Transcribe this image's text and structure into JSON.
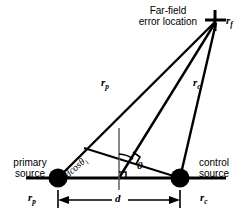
{
  "figure": {
    "title_note": "Far-field error location geometry for primary and control sources",
    "background_color": "#ffffff",
    "stroke_color": "#000000",
    "labels": {
      "farfield_line1": "Far-field",
      "farfield_line2": "error  location",
      "primary_line1": "primary",
      "primary_line2": "source",
      "control_line1": "control",
      "control_line2": "source",
      "r_f": "r",
      "r_f_sub": "f",
      "r_p_path": "r",
      "r_p_path_sub": "p",
      "r_c_path": "r",
      "r_c_path_sub": "c",
      "r_p_axis": "r",
      "r_p_axis_sub": "p",
      "r_c_axis": "r",
      "r_c_axis_sub": "c",
      "separation": "d",
      "angle": "θ",
      "projection": "dcosθ",
      "projection_sub": "i"
    },
    "geometry": {
      "primary_source_point": [
        58,
        178
      ],
      "control_source_point": [
        180,
        178
      ],
      "far_field_point": [
        216,
        21
      ],
      "midpoint_x": 119,
      "baseline_y": 178,
      "dimension_line_y": 200,
      "source_dot_radius": 9.5,
      "angle_degrees": 13
    }
  }
}
